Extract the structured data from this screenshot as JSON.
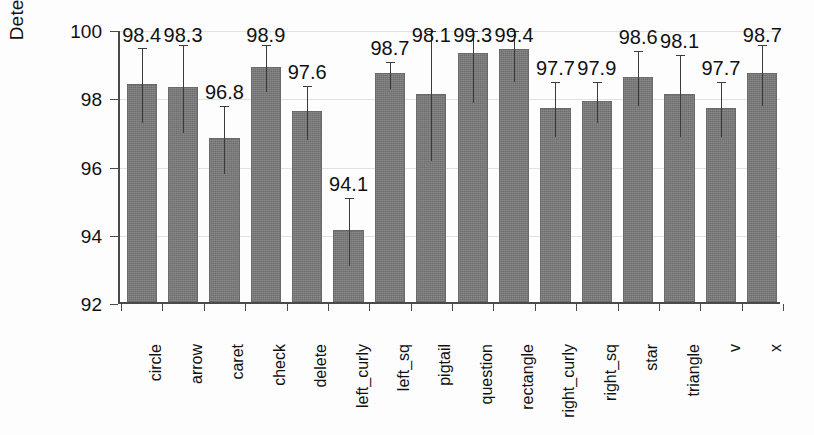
{
  "chart_data": {
    "type": "bar",
    "title": "",
    "xlabel": "",
    "ylabel": "Detection rate [%]",
    "ylim": [
      92,
      100
    ],
    "yticks": [
      92,
      94,
      96,
      98,
      100
    ],
    "ytick_labels": [
      "92",
      "94",
      "96",
      "98",
      "100"
    ],
    "grid": true,
    "legend": "none",
    "error_bars": true,
    "value_labels": true,
    "categories": [
      "circle",
      "arrow",
      "caret",
      "check",
      "delete",
      "left_curly",
      "left_sq",
      "pigtail",
      "question",
      "rectangle",
      "right_curly",
      "right_sq",
      "star",
      "triangle",
      "v",
      "x"
    ],
    "values": [
      98.4,
      98.3,
      96.8,
      98.9,
      97.6,
      94.1,
      98.7,
      98.1,
      99.3,
      99.4,
      97.7,
      97.9,
      98.6,
      98.1,
      97.7,
      98.7
    ],
    "value_label_text": [
      "98.4",
      "98.3",
      "96.8",
      "98.9",
      "97.6",
      "94.1",
      "98.7",
      "98.1",
      "99.3",
      "99.4",
      "97.7",
      "97.9",
      "98.6",
      "98.1",
      "97.7",
      "98.7"
    ],
    "errors": [
      1.1,
      1.3,
      1.0,
      0.7,
      0.8,
      1.0,
      0.4,
      1.9,
      1.4,
      0.9,
      0.8,
      0.6,
      0.8,
      1.2,
      0.8,
      0.9
    ],
    "bar_color": "#787878",
    "error_bar_color": "#3b3b3b",
    "axis_color": "#4a4a4a",
    "grid_color": "#e2e2e2",
    "background_color": "#fdfdfd"
  }
}
